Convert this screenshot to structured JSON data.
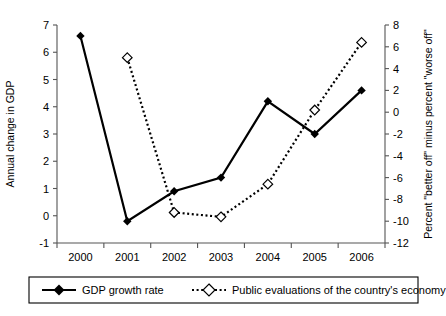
{
  "chart_data": {
    "type": "line",
    "title": "",
    "xlabel": "",
    "categories": [
      "2000",
      "2001",
      "2002",
      "2003",
      "2004",
      "2005",
      "2006"
    ],
    "x": [
      2000,
      2001,
      2002,
      2003,
      2004,
      2005,
      2006
    ],
    "grid": false,
    "legend_position": "bottom",
    "left_axis": {
      "label": "Annual change in GDP",
      "ylim": [
        -1,
        7
      ],
      "ticks": [
        -1,
        0,
        1,
        2,
        3,
        4,
        5,
        6,
        7
      ],
      "tick_labels": [
        "-1",
        "0",
        "1",
        "2",
        "3",
        "4",
        "5",
        "6",
        "7"
      ]
    },
    "right_axis": {
      "label": "Percent \"better off\" minus percent \"worse off\"",
      "ylim": [
        -12,
        8
      ],
      "ticks": [
        -12,
        -10,
        -8,
        -6,
        -4,
        -2,
        0,
        2,
        4,
        6,
        8
      ],
      "tick_labels": [
        "-12",
        "-10",
        "-8",
        "-6",
        "-4",
        "-2",
        "0",
        "2",
        "4",
        "6",
        "8"
      ]
    },
    "series": [
      {
        "name": "GDP growth rate",
        "axis": "left",
        "marker": "filled-diamond",
        "line_style": "solid",
        "color": "#000000",
        "x": [
          2000,
          2001,
          2002,
          2003,
          2004,
          2005,
          2006
        ],
        "values": [
          6.6,
          -0.2,
          0.9,
          1.4,
          4.2,
          3.0,
          4.6
        ]
      },
      {
        "name": "Public evaluations of the country's economy",
        "axis": "right",
        "marker": "open-diamond",
        "line_style": "dotted",
        "color": "#000000",
        "x": [
          2001,
          2002,
          2003,
          2004,
          2005,
          2006
        ],
        "values": [
          5.0,
          -9.2,
          -9.6,
          -6.6,
          0.2,
          6.4
        ]
      }
    ]
  },
  "legend": {
    "items": [
      {
        "label": "GDP growth rate",
        "marker": "filled-diamond",
        "line_style": "solid"
      },
      {
        "label": "Public evaluations of the country's economy",
        "marker": "open-diamond",
        "line_style": "dotted"
      }
    ]
  }
}
